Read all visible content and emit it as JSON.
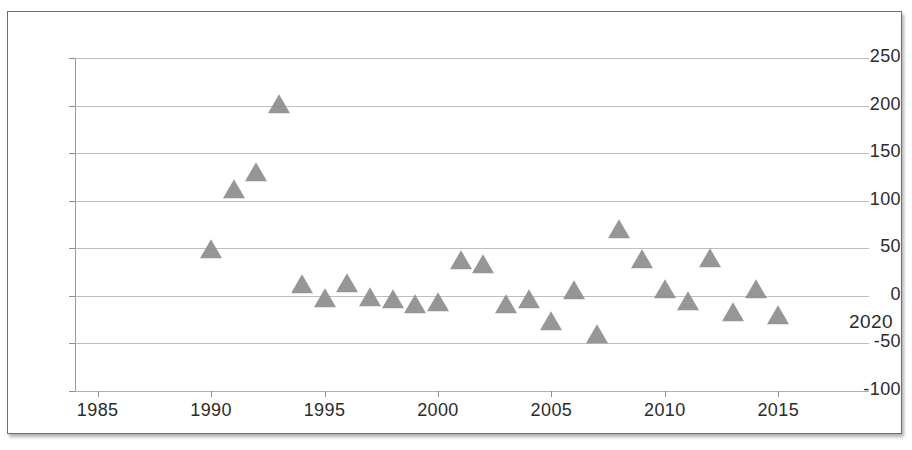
{
  "chart_data": {
    "type": "scatter",
    "title": "",
    "xlabel": "",
    "ylabel": "",
    "xlim": [
      1984,
      2019
    ],
    "ylim": [
      -100,
      250
    ],
    "ytick_values": [
      250,
      200,
      150,
      100,
      50,
      0,
      -50,
      -100
    ],
    "ytick_labels": [
      "250",
      "200",
      "150",
      "100",
      "50",
      "0",
      "-50",
      "-100"
    ],
    "xtick_values": [
      1985,
      1990,
      1995,
      2000,
      2005,
      2010,
      2015
    ],
    "xtick_labels": [
      "1985",
      "1990",
      "1995",
      "2000",
      "2005",
      "2010",
      "2015"
    ],
    "grid": true,
    "grid_axis": "y",
    "legend": false,
    "marker": "triangle",
    "marker_color": "#8d8d8d",
    "series": [
      {
        "name": "series-1",
        "x": [
          1990,
          1991,
          1992,
          1993,
          1994,
          1995,
          1996,
          1997,
          1998,
          1999,
          2000,
          2001,
          2002,
          2003,
          2004,
          2005,
          2006,
          2007,
          2008,
          2009,
          2010,
          2011,
          2012,
          2013,
          2014,
          2015
        ],
        "y": [
          47,
          110,
          128,
          200,
          10,
          -4,
          11,
          -3,
          -5,
          -11,
          -9,
          36,
          31,
          -11,
          -5,
          -29,
          4,
          -42,
          68,
          37,
          5,
          -8,
          38,
          -19,
          5,
          -22
        ]
      }
    ],
    "annotations": [
      {
        "text": "2020",
        "x_px": 848,
        "y_px": 322
      }
    ]
  },
  "frame": {
    "border_color": "#6f6f6f",
    "background": "#ffffff"
  }
}
